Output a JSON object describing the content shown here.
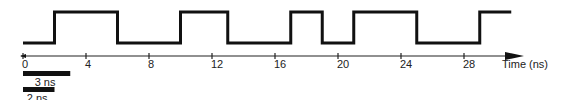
{
  "diagram": {
    "type": "timing-diagram",
    "axis": {
      "label": "Time (ns)",
      "ticks": [
        0,
        4,
        8,
        12,
        16,
        20,
        24,
        28
      ],
      "tick_labels": [
        "0",
        "4",
        "8",
        "12",
        "16",
        "20",
        "24",
        "28"
      ]
    },
    "waveform": {
      "initial_level": "low",
      "transitions_ns": [
        2,
        6,
        10,
        13,
        17,
        19,
        21,
        25,
        29
      ],
      "end_ns": 31
    },
    "scale_bars": [
      {
        "label": "3 ns",
        "length_ns": 3
      },
      {
        "label": "2 ns",
        "length_ns": 2
      }
    ],
    "colors": {
      "line": "#111111",
      "background": "#ffffff"
    }
  }
}
